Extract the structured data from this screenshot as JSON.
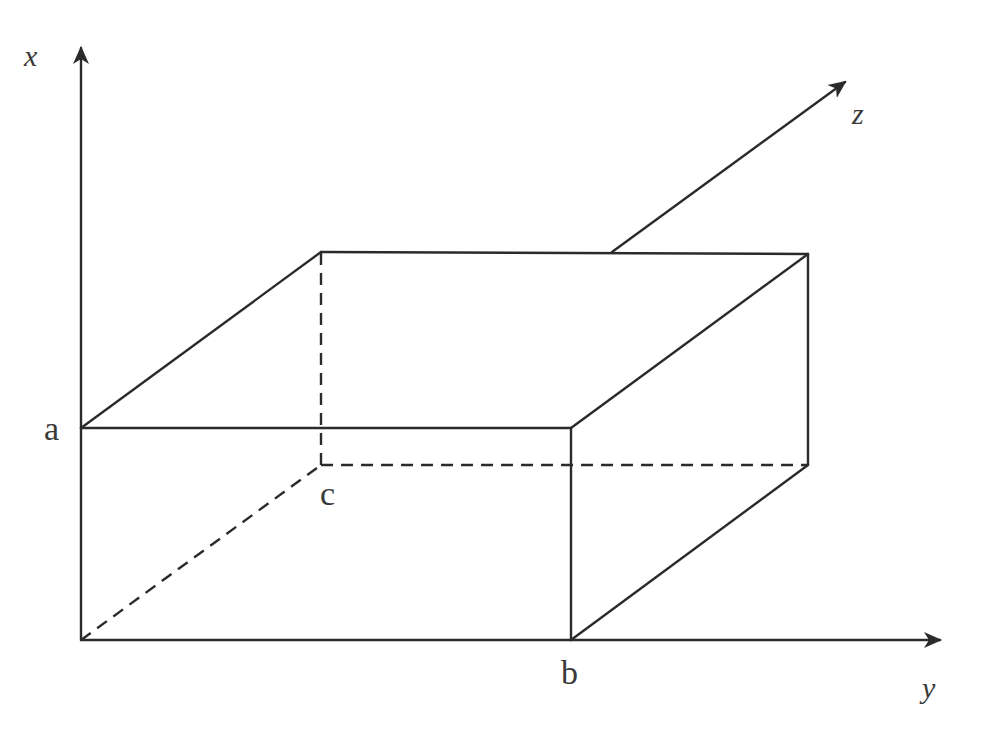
{
  "diagram": {
    "axes": {
      "x": {
        "label": "x"
      },
      "y": {
        "label": "y"
      },
      "z": {
        "label": "z"
      }
    },
    "points": {
      "a": {
        "label": "a"
      },
      "b": {
        "label": "b"
      },
      "c": {
        "label": "c"
      }
    },
    "colors": {
      "stroke": "#2b2b2b",
      "text": "#3a3a3a",
      "background": "#ffffff"
    }
  }
}
